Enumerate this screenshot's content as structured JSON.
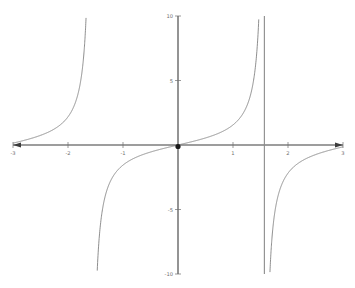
{
  "chart_data": {
    "type": "line",
    "title": "",
    "subtitle": "",
    "xlabel": "",
    "ylabel": "",
    "xlim": [
      -3,
      3
    ],
    "ylim": [
      -10,
      10
    ],
    "grid": false,
    "legend": null,
    "x_ticks": [
      -3,
      -2,
      -1,
      1,
      2,
      3
    ],
    "x_tick_labels": [
      "-3",
      "-2",
      "-1",
      "1",
      "2",
      "3"
    ],
    "y_ticks": [
      10,
      5,
      -5,
      -10
    ],
    "y_tick_labels": [
      "10",
      "5",
      "-5",
      "-10"
    ],
    "asymptotes": [
      -1.5708,
      1.5708
    ],
    "marked_points": [
      {
        "x": 0,
        "y": 0,
        "label": ""
      }
    ],
    "series": [
      {
        "name": "y = tan(x)",
        "color": "#7a7a7a",
        "branches": [
          {
            "name": "left-branch",
            "x_range": [
              -3,
              -1.5708
            ],
            "points": [
              [
                -3.0,
                0.1425
              ],
              [
                -2.9,
                0.2393
              ],
              [
                -2.8,
                0.3555
              ],
              [
                -2.7,
                0.4727
              ],
              [
                -2.6,
                0.6016
              ],
              [
                -2.5,
                0.747
              ],
              [
                -2.4,
                0.916
              ],
              [
                -2.3,
                1.1192
              ],
              [
                -2.2,
                1.3738
              ],
              [
                -2.1,
                1.7098
              ],
              [
                -2.0,
                2.185
              ],
              [
                -1.95,
                2.495
              ],
              [
                -1.9,
                2.9271
              ],
              [
                -1.85,
                3.5536
              ],
              [
                -1.8,
                4.2863
              ],
              [
                -1.78,
                4.7561
              ],
              [
                -1.76,
                5.3319
              ],
              [
                -1.74,
                6.053
              ],
              [
                -1.72,
                6.9813
              ],
              [
                -1.7,
                8.2381
              ],
              [
                -1.68,
                10.0
              ]
            ]
          },
          {
            "name": "center-branch",
            "x_range": [
              -1.5708,
              1.5708
            ],
            "points": [
              [
                -1.4712,
                -10.0
              ],
              [
                -1.49,
                -12.35
              ],
              [
                -1.45,
                -8.24
              ],
              [
                -1.42,
                -6.58
              ],
              [
                -1.38,
                -5.18
              ],
              [
                -1.34,
                -4.29
              ],
              [
                -1.3,
                -3.6
              ],
              [
                -1.2,
                -2.57
              ],
              [
                -1.1,
                -1.96
              ],
              [
                -1.0,
                -1.557
              ],
              [
                -0.9,
                -1.26
              ],
              [
                -0.8,
                -1.03
              ],
              [
                -0.7,
                -0.842
              ],
              [
                -0.6,
                -0.684
              ],
              [
                -0.5,
                -0.546
              ],
              [
                -0.4,
                -0.423
              ],
              [
                -0.3,
                -0.309
              ],
              [
                -0.2,
                -0.203
              ],
              [
                -0.1,
                -0.1
              ],
              [
                0.0,
                0.0
              ],
              [
                0.1,
                0.1
              ],
              [
                0.2,
                0.203
              ],
              [
                0.3,
                0.309
              ],
              [
                0.4,
                0.423
              ],
              [
                0.5,
                0.546
              ],
              [
                0.6,
                0.684
              ],
              [
                0.7,
                0.842
              ],
              [
                0.8,
                1.03
              ],
              [
                0.9,
                1.26
              ],
              [
                1.0,
                1.557
              ],
              [
                1.1,
                1.965
              ],
              [
                1.2,
                2.572
              ],
              [
                1.3,
                3.602
              ],
              [
                1.34,
                4.286
              ],
              [
                1.38,
                5.177
              ],
              [
                1.42,
                6.581
              ],
              [
                1.45,
                8.238
              ],
              [
                1.4712,
                10.0
              ]
            ]
          },
          {
            "name": "right-branch",
            "x_range": [
              1.5708,
              3
            ],
            "points": [
              [
                1.68,
                -10.0
              ],
              [
                1.7,
                -8.238
              ],
              [
                1.72,
                -6.981
              ],
              [
                1.74,
                -6.053
              ],
              [
                1.76,
                -5.332
              ],
              [
                1.78,
                -4.756
              ],
              [
                1.8,
                -4.286
              ],
              [
                1.85,
                -3.554
              ],
              [
                1.9,
                -2.927
              ],
              [
                1.95,
                -2.495
              ],
              [
                2.0,
                -2.185
              ],
              [
                2.1,
                -1.71
              ],
              [
                2.2,
                -1.374
              ],
              [
                2.3,
                -1.119
              ],
              [
                2.4,
                -0.916
              ],
              [
                2.5,
                -0.747
              ],
              [
                2.6,
                -0.602
              ],
              [
                2.7,
                -0.473
              ],
              [
                2.8,
                -0.356
              ],
              [
                2.9,
                -0.239
              ],
              [
                3.0,
                -0.143
              ]
            ]
          }
        ]
      }
    ]
  },
  "geometry": {
    "origin_px": [
      178,
      145
    ],
    "x_axis_left_px": 13,
    "x_axis_right_px": 343,
    "y_axis_top_px": 16,
    "y_axis_bottom_px": 274,
    "px_per_x_unit": 55,
    "px_per_y_unit": 12.9
  },
  "colors": {
    "background": "#ffffff",
    "axis": "#3c3c3c",
    "curve": "#7a7a7a",
    "asymptote": "#8a8a8a",
    "tick_text": "#6e6e6e",
    "origin_dot": "#1a1a1a"
  }
}
